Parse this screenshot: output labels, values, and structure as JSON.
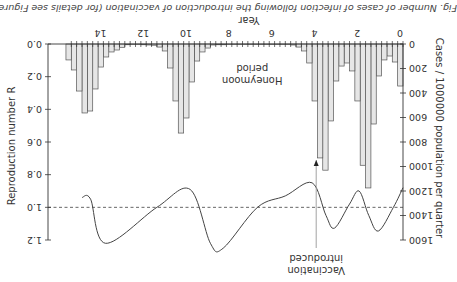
{
  "figure": {
    "orientation": "rotated 180 degrees",
    "caption": "Fig. Number of cases of infection following the introduction of vaccination (for details see Figure 14.6)."
  },
  "chart_data": {
    "type": "bar+line",
    "title": "",
    "xlabel": "Year",
    "x_ticks": [
      0,
      2,
      4,
      6,
      8,
      10,
      12,
      14
    ],
    "xlim": [
      0,
      15
    ],
    "bar_series": {
      "name": "Cases / 1000000 population per quarter",
      "axis": "left",
      "ylabel": "Cases / 1000000 population per quarter",
      "y_ticks": [
        0,
        200,
        400,
        600,
        800,
        1000,
        1200,
        1400,
        1600
      ],
      "ylim": [
        0,
        1600
      ],
      "quarter_values": [
        343,
        147,
        98,
        130,
        261,
        653,
        1175,
        990,
        465,
        220,
        155,
        180,
        302,
        628,
        1030,
        930,
        465,
        155,
        57,
        25,
        8,
        5,
        4,
        3,
        3,
        3,
        3,
        3,
        4,
        4,
        5,
        5,
        5,
        6,
        6,
        8,
        33,
        65,
        139,
        310,
        604,
        727,
        465,
        196,
        57,
        25,
        10,
        8,
        6,
        5,
        5,
        6,
        27,
        49,
        65,
        106,
        188,
        367,
        547,
        563,
        384,
        212,
        130
      ],
      "fill": "#e6e6e6",
      "stroke": "#555555"
    },
    "line_series": {
      "name": "Reproduction number R",
      "axis": "right",
      "ylabel": "Reproduction number R",
      "y_ticks": [
        0.0,
        0.2,
        0.4,
        0.6,
        0.8,
        1.0,
        1.2
      ],
      "ylim": [
        0.0,
        1.2
      ],
      "points": [
        {
          "year": 0.0,
          "R": 0.88
        },
        {
          "year": 0.45,
          "R": 1.0
        },
        {
          "year": 1.15,
          "R": 1.145
        },
        {
          "year": 1.6,
          "R": 1.05
        },
        {
          "year": 2.05,
          "R": 0.9
        },
        {
          "year": 2.5,
          "R": 0.98
        },
        {
          "year": 3.2,
          "R": 1.127
        },
        {
          "year": 3.6,
          "R": 1.05
        },
        {
          "year": 4.25,
          "R": 0.85
        },
        {
          "year": 5.5,
          "R": 0.93
        },
        {
          "year": 6.8,
          "R": 1.0
        },
        {
          "year": 8.4,
          "R": 1.25
        },
        {
          "year": 9.0,
          "R": 1.22
        },
        {
          "year": 9.95,
          "R": 0.89
        },
        {
          "year": 11.5,
          "R": 1.0
        },
        {
          "year": 13.9,
          "R": 1.22
        },
        {
          "year": 14.6,
          "R": 0.95
        },
        {
          "year": 15.0,
          "R": 0.94
        }
      ],
      "reference_line": {
        "R": 1.0,
        "style": "dashed"
      }
    },
    "annotations": [
      {
        "text_lines": [
          "Vaccination",
          "introduced"
        ],
        "year": 4.0,
        "type": "arrow"
      },
      {
        "text_lines": [
          "Honeymoon",
          "period"
        ],
        "year": 7.0,
        "type": "label"
      }
    ],
    "grid": false,
    "legend": "none"
  },
  "labels": {
    "x_axis_title": "Year",
    "left_axis_title": "Cases / 1000000 population per quarter",
    "right_axis_title": "Reproduction number R",
    "x_tick_labels": [
      "0",
      "2",
      "4",
      "6",
      "8",
      "10",
      "12",
      "14"
    ],
    "left_tick_labels": [
      "0",
      "200",
      "400",
      "600",
      "800",
      "1000",
      "1200",
      "1400",
      "1600"
    ],
    "right_tick_labels": [
      "0.0",
      "0.2",
      "0.4",
      "0.6",
      "0.8",
      "1.0",
      "1.2"
    ],
    "vaccination_line1": "Vaccination",
    "vaccination_line2": "introduced",
    "honeymoon_line1": "Honeymoon",
    "honeymoon_line2": "period"
  }
}
